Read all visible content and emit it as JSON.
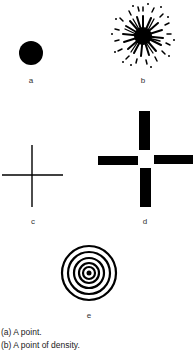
{
  "figure": {
    "panels": [
      {
        "id": "a",
        "label": "a",
        "shape": "solid-point-icon"
      },
      {
        "id": "b",
        "label": "b",
        "shape": "starburst-density-icon"
      },
      {
        "id": "c",
        "label": "c",
        "shape": "thin-cross-icon"
      },
      {
        "id": "d",
        "label": "d",
        "shape": "thick-broken-cross-icon"
      },
      {
        "id": "e",
        "label": "e",
        "shape": "concentric-circles-icon"
      }
    ],
    "captions": [
      "(a) A point.",
      "(b) A point of density."
    ],
    "colors": {
      "ink": "#000000",
      "background": "#ffffff",
      "label": "#333333"
    }
  }
}
